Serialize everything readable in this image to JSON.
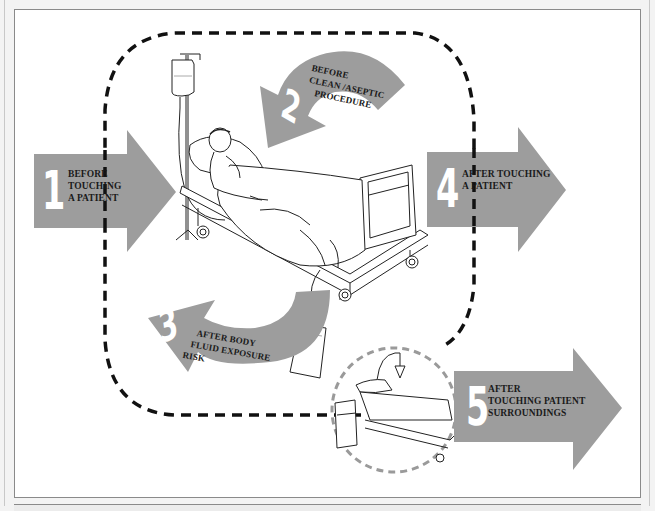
{
  "colors": {
    "arrow_fill": "#9d9d9d",
    "zone_dash": "#111111",
    "surroundings_dash": "#9a9a9a",
    "number_fill": "#ffffff",
    "label_text": "#1a1a1a",
    "panel_border": "#8a8a8a",
    "page_bg": "#f3f3f3"
  },
  "patient_zone": {
    "label": "Patient zone",
    "style": "dashed rounded rectangle"
  },
  "surroundings_zone": {
    "label": "Patient surroundings",
    "style": "dashed circle"
  },
  "moments": [
    {
      "number": "1",
      "label_lines": [
        "BEFORE",
        "TOUCHING",
        "A PATIENT"
      ],
      "direction": "into patient zone"
    },
    {
      "number": "2",
      "label_lines": [
        "BEFORE",
        "CLEAN /ASEPTIC",
        "PROCEDURE"
      ],
      "direction": "curved toward patient"
    },
    {
      "number": "3",
      "label_lines": [
        "AFTER BODY",
        "FLUID EXPOSURE",
        "RISK"
      ],
      "direction": "curved away from patient"
    },
    {
      "number": "4",
      "label_lines": [
        "AFTER TOUCHING",
        "A PATIENT"
      ],
      "direction": "out of patient zone"
    },
    {
      "number": "5",
      "label_lines": [
        "AFTER",
        "TOUCHING PATIENT",
        "SURROUNDINGS"
      ],
      "direction": "out of surroundings"
    }
  ],
  "illustrations": {
    "main": "patient-in-hospital-bed",
    "iv_drip": "iv-drip-stand",
    "drainage": "urine-drainage-bag",
    "surroundings": "empty-bed-and-bedside-cabinet"
  }
}
